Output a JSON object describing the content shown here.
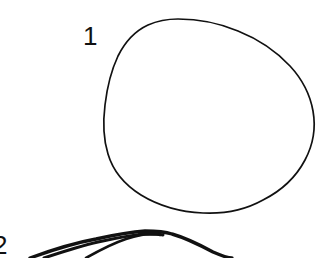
{
  "figure": {
    "background_color": "#ffffff",
    "ink_color": "#111111",
    "width": 331,
    "height": 258
  },
  "labels": {
    "shape_one": "1",
    "shape_two": "2"
  },
  "shapes": [
    {
      "id": "shape-1",
      "label": "1",
      "kind": "closed-freehand-circle",
      "stroke_width": 1.7,
      "stroke_color": "#111111",
      "fill": "none",
      "bounds": {
        "x": 104,
        "y": 19,
        "width": 210,
        "height": 194
      }
    },
    {
      "id": "shape-2",
      "label": "2",
      "kind": "open-freehand-arcs",
      "stroke_width": 3.2,
      "stroke_color": "#111111",
      "fill": "none",
      "clipped": true,
      "bounds": {
        "x": 0,
        "y": 230,
        "width": 235,
        "height": 28
      }
    }
  ]
}
